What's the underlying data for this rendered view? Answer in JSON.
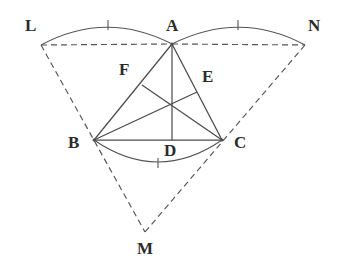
{
  "figure": {
    "kind": "euclidean-geometry-diagram",
    "background_color": "#ffffff",
    "stroke_color": "#4a4a4a",
    "label_color": "#2b2b2b",
    "width": 347,
    "height": 280
  },
  "points": [
    {
      "id": "A",
      "label": "A",
      "x": 172,
      "y": 44,
      "label_x": 166,
      "label_y": 17
    },
    {
      "id": "B",
      "label": "B",
      "x": 94,
      "y": 140,
      "label_x": 68,
      "label_y": 134
    },
    {
      "id": "C",
      "label": "C",
      "x": 222,
      "y": 140,
      "label_x": 234,
      "label_y": 134
    },
    {
      "id": "D",
      "label": "D",
      "x": 172,
      "y": 140,
      "label_x": 164,
      "label_y": 142
    },
    {
      "id": "E",
      "label": "E",
      "x": 197,
      "y": 92,
      "label_x": 202,
      "label_y": 68
    },
    {
      "id": "F",
      "label": "F",
      "x": 142,
      "y": 85,
      "label_x": 119,
      "label_y": 61
    },
    {
      "id": "L",
      "label": "L",
      "x": 41,
      "y": 45,
      "label_x": 25,
      "label_y": 17
    },
    {
      "id": "N",
      "label": "N",
      "x": 305,
      "y": 45,
      "label_x": 308,
      "label_y": 17
    },
    {
      "id": "M",
      "label": "M",
      "x": 145,
      "y": 232,
      "label_x": 137,
      "label_y": 240
    }
  ],
  "solid_segments": [
    {
      "name": "side-AB",
      "from": "A",
      "to": "B"
    },
    {
      "name": "side-AC",
      "from": "A",
      "to": "C"
    },
    {
      "name": "side-BC",
      "from": "B",
      "to": "C"
    },
    {
      "name": "median-AD",
      "from": "A",
      "to": "D"
    },
    {
      "name": "median-BE",
      "from": "B",
      "to": "E"
    },
    {
      "name": "median-CF",
      "from": "C",
      "to": "F"
    }
  ],
  "dashed_segments": [
    {
      "name": "chord-LA",
      "from": "L",
      "to": "A"
    },
    {
      "name": "chord-AN",
      "from": "A",
      "to": "N"
    },
    {
      "name": "ray-LB-M",
      "from": "L",
      "to": "M"
    },
    {
      "name": "ray-NC-M",
      "from": "N",
      "to": "M"
    }
  ],
  "arcs": [
    {
      "name": "arc-LA",
      "from": "L",
      "to": "A",
      "bulge": "up",
      "tick_x": 108,
      "tick_y": 25
    },
    {
      "name": "arc-AN",
      "from": "A",
      "to": "N",
      "bulge": "up",
      "tick_x": 238,
      "tick_y": 25
    },
    {
      "name": "arc-BC",
      "from": "B",
      "to": "C",
      "bulge": "down",
      "tick_x": 158,
      "tick_y": 163
    }
  ],
  "concurrency_point": {
    "name": "centroid",
    "x": 172,
    "y": 102
  },
  "tick_marks_count": 3
}
